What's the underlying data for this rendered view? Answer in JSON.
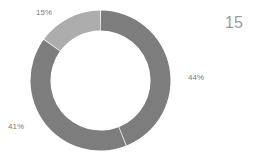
{
  "chart_data": {
    "type": "pie",
    "variant": "donut",
    "title": "",
    "subtitle": "",
    "xlabel": "",
    "ylabel": "",
    "legend": "none",
    "grid": false,
    "labels": [
      "44%",
      "41%",
      "15%"
    ],
    "values": [
      44,
      41,
      15
    ],
    "value_labels": [
      "44%",
      "41%",
      "15%"
    ],
    "colors": [
      "#7d7d7d",
      "#7d7d7d",
      "#adadad"
    ],
    "start_angle_deg": 0,
    "direction": "clockwise",
    "inner_radius_ratio": 0.715,
    "separator_color": "#ffffff",
    "annotations": [
      "15"
    ]
  },
  "chart": {
    "slice_1_label": "44%",
    "slice_2_label": "41%",
    "slice_3_label": "15%",
    "corner_number": "15"
  }
}
